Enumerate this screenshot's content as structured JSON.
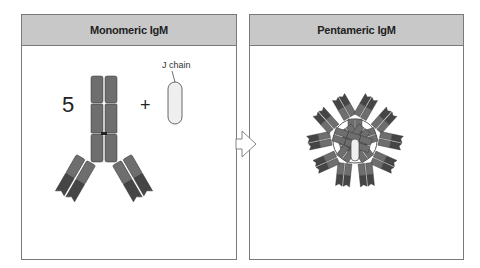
{
  "left_panel": {
    "title": "Monomeric IgM",
    "count": "5",
    "operator": "+",
    "j_chain_label": "J chain"
  },
  "right_panel": {
    "title": "Pentameric IgM"
  },
  "arrow": {
    "icon": "arrow-right-icon"
  },
  "colors": {
    "header_bg": "#c8c8c8",
    "border": "#7a7a7a",
    "domain_light": "#6e6e6e",
    "domain_dark": "#454545",
    "j_chain_fill": "#efefef"
  }
}
